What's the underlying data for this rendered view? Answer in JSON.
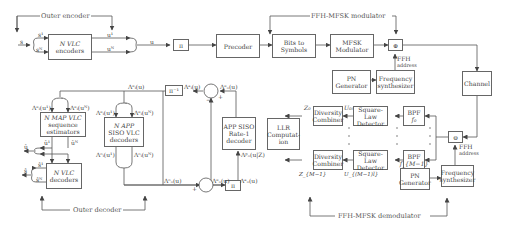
{
  "sections": {
    "outer_encoder": "Outer encoder",
    "ffh_modulator": "FFH-MFSK modulator",
    "outer_decoder": "Outer decoder",
    "ffh_demodulator": "FFH-MFSK demodulator"
  },
  "blocks": {
    "vlc_encoders": [
      "N VLC",
      "encoders"
    ],
    "interleaver_top": "π",
    "precoder": "Precoder",
    "bits_to_symbols": [
      "Bits to",
      "Symbols"
    ],
    "mfsk_modulator": [
      "MFSK",
      "Modulator"
    ],
    "mixer_tx": "⊕",
    "pn_generator_tx": [
      "PN",
      "Generator"
    ],
    "freq_synth_tx": [
      "Frequency",
      "synthesizer"
    ],
    "channel": "Channel",
    "map_vlc": [
      "N MAP VLC",
      "sequence",
      "estimators"
    ],
    "app_siso_vlc": [
      "N APP",
      "SISO VLC",
      "decoders"
    ],
    "vlc_decoders": [
      "N VLC",
      "decoders"
    ],
    "deinterleaver": "π⁻¹",
    "interleaver_bottom": "π",
    "app_siso_rate1": [
      "APP SISO",
      "Rate-1",
      "decoder"
    ],
    "llr_computation": [
      "LLR",
      "Computat-",
      "ion"
    ],
    "diversity_combiner_0": [
      "Diversity",
      "Combiner"
    ],
    "diversity_combiner_m1": [
      "Diversity",
      "Combiner"
    ],
    "square_law_0": [
      "Square-Law",
      "Detector"
    ],
    "square_law_m1": [
      "Square-Law",
      "Detector"
    ],
    "bpf_0": [
      "BPF",
      "f₀"
    ],
    "bpf_m1": [
      "BPF",
      "f_{M−1}"
    ],
    "mixer_rx": "⊖",
    "pn_generator_rx": [
      "PN",
      "Generator"
    ],
    "freq_synth_rx": [
      "Frequency",
      "synthesizer"
    ]
  },
  "signals": {
    "s": "s",
    "s1": "s¹",
    "sN": "sᴺ",
    "u1": "u¹",
    "uN": "uᴺ",
    "u": "u",
    "ffh_address_tx": [
      "FFH",
      "address"
    ],
    "ffh_address_rx": [
      "FFH",
      "address"
    ],
    "lambda_e_i_u_top": "Λᵉᵢ(u)",
    "lambda_e_i_u1": "Λᵉᵢ(u¹)",
    "lambda_e_i_uN": "Λᵉᵢ(uᴺ)",
    "lambda_o_i_u1": "Λᵒᵢ(u¹)",
    "lambda_o_i_uN": "Λᵒᵢ(uᴺ)",
    "lambda_a_i_u_deint": "Λᵃᵢ(u)",
    "lambda_e_o_u_sum": "Λᵉₒ(u)",
    "lambda_o_o_u": "Λᵒₒ(u)",
    "lambda_e_o_u_bottom": "Λᵉₒ(u)",
    "lambda_a_o_u": "Λᵃₒ(u)",
    "lambda_p_uz": "Λᵖₒ(u|Z)",
    "u_hat1": "û¹",
    "u_hatN": "ûᴺ",
    "u_hat": "û",
    "s_hat1": "ŝ¹",
    "s_hatN": "ŝᴺ",
    "s_hat": "ŝ",
    "Z0": "Z₀",
    "ZM1": "Z_{M−1}",
    "U0l": "U₀ₗ",
    "UM1l": "U_{(M−1)l}",
    "plus": "+",
    "minus": "−"
  }
}
